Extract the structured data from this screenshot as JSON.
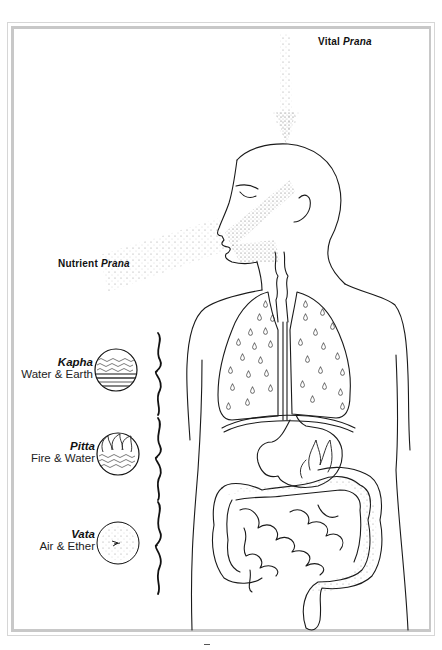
{
  "diagram": {
    "labels": {
      "vital_prana": {
        "word": "Vital ",
        "emph": "Prana"
      },
      "nutrient_prana": {
        "word": "Nutrient ",
        "emph": "Prana"
      }
    },
    "doshas": [
      {
        "name": "Kapha",
        "elements": "Water & Earth",
        "icon": "water-earth-circle-icon"
      },
      {
        "name": "Pitta",
        "elements": "Fire & Water",
        "icon": "fire-water-circle-icon"
      },
      {
        "name": "Vata",
        "elements": "Air & Ether",
        "icon": "air-ether-circle-icon"
      }
    ],
    "colors": {
      "line": "#1a1a1a",
      "frame": "#c8c8c8",
      "stipple": "#777777"
    }
  }
}
